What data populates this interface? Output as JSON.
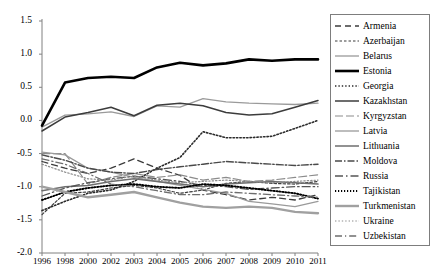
{
  "chart_data": {
    "type": "line",
    "title": "",
    "xlabel": "",
    "ylabel": "",
    "ylim": [
      -2.0,
      1.5
    ],
    "yticks": [
      "1.5",
      "1.0",
      "0.5",
      "0.0",
      "-0.5",
      "-1.0",
      "-1.5",
      "-2.0"
    ],
    "ytick_values": [
      1.5,
      1.0,
      0.5,
      0.0,
      -0.5,
      -1.0,
      -1.5,
      -2.0
    ],
    "grid": false,
    "legend_position": "right",
    "categories": [
      "1996",
      "1998",
      "2000",
      "2002",
      "2003",
      "2004",
      "2005",
      "2006",
      "2007",
      "2008",
      "2009",
      "2010",
      "2011"
    ],
    "series": [
      {
        "name": "Armenia",
        "color": "#3c3c3c",
        "dash": "6,4",
        "width": 1.3,
        "values": [
          -0.62,
          -0.72,
          -0.8,
          -0.72,
          -0.58,
          -0.72,
          -0.83,
          -1.05,
          -1.12,
          -1.2,
          -1.16,
          -1.2,
          -1.12
        ]
      },
      {
        "name": "Azerbaijan",
        "color": "#3c3c3c",
        "dash": "2.5,2",
        "width": 1.2,
        "values": [
          -1.42,
          -1.1,
          -1.08,
          -1.02,
          -0.98,
          -1.02,
          -1.1,
          -1.05,
          -0.95,
          -0.92,
          -0.95,
          -0.96,
          -0.92
        ]
      },
      {
        "name": "Belarus",
        "color": "#9a9a9a",
        "dash": "none",
        "width": 1.3,
        "values": [
          -0.1,
          0.08,
          0.1,
          0.13,
          0.06,
          0.22,
          0.2,
          0.33,
          0.28,
          0.26,
          0.25,
          0.24,
          0.26
        ]
      },
      {
        "name": "Estonia",
        "color": "#000000",
        "dash": "none",
        "width": 2.6,
        "values": [
          -0.08,
          0.57,
          0.64,
          0.66,
          0.64,
          0.8,
          0.87,
          0.83,
          0.86,
          0.92,
          0.9,
          0.92,
          0.92
        ]
      },
      {
        "name": "Georgia",
        "color": "#2b2b2b",
        "dash": "1.4,2",
        "width": 1.6,
        "values": [
          -1.36,
          -1.22,
          -1.1,
          -1.05,
          -0.92,
          -0.72,
          -0.56,
          -0.17,
          -0.26,
          -0.26,
          -0.24,
          -0.12,
          0.0
        ]
      },
      {
        "name": "Kazakhstan",
        "color": "#3c3c3c",
        "dash": "none",
        "width": 1.5,
        "values": [
          -0.16,
          0.05,
          0.12,
          0.2,
          0.07,
          0.23,
          0.26,
          0.22,
          0.12,
          0.08,
          0.1,
          0.2,
          0.3
        ]
      },
      {
        "name": "Kyrgyzstan",
        "color": "#8c8c8c",
        "dash": "8,3",
        "width": 1.2,
        "values": [
          -0.5,
          -0.5,
          -0.96,
          -0.86,
          -0.8,
          -0.86,
          -0.82,
          -0.9,
          -0.86,
          -0.92,
          -0.9,
          -0.86,
          -0.82
        ]
      },
      {
        "name": "Latvia",
        "color": "#9a9a9a",
        "dash": "none",
        "width": 1.3,
        "values": [
          -0.48,
          -0.52,
          -0.72,
          -0.78,
          -0.86,
          -0.92,
          -0.98,
          -1.04,
          -1.1,
          -1.22,
          -1.26,
          -1.3,
          -1.22
        ]
      },
      {
        "name": "Lithuania",
        "color": "#6e6e6e",
        "dash": "none",
        "width": 1.5,
        "values": [
          -1.06,
          -1.0,
          -0.98,
          -0.92,
          -0.88,
          -0.92,
          -0.96,
          -1.0,
          -0.96,
          -0.94,
          -0.92,
          -0.94,
          -0.96
        ]
      },
      {
        "name": "Moldova",
        "color": "#4a4a4a",
        "dash": "7,2,1.5,2",
        "width": 1.4,
        "values": [
          -0.52,
          -0.6,
          -0.72,
          -0.78,
          -0.8,
          -0.74,
          -0.7,
          -0.66,
          -0.62,
          -0.64,
          -0.66,
          -0.68,
          -0.66
        ]
      },
      {
        "name": "Russia",
        "color": "#555555",
        "dash": "8,3,1.5,3",
        "width": 1.3,
        "values": [
          -1.14,
          -1.02,
          -0.94,
          -0.88,
          -0.84,
          -0.88,
          -0.92,
          -0.98,
          -1.0,
          -1.04,
          -1.02,
          -1.0,
          -1.0
        ]
      },
      {
        "name": "Tajikistan",
        "color": "#000000",
        "dash": "1.2,1.8",
        "width": 1.9,
        "values": [
          -1.2,
          -1.08,
          -1.02,
          -0.98,
          -0.96,
          -1.0,
          -1.02,
          -0.96,
          -0.98,
          -1.02,
          -1.06,
          -1.1,
          -1.18
        ]
      },
      {
        "name": "Turkmenistan",
        "color": "#a0a0a0",
        "dash": "none",
        "width": 2.4,
        "values": [
          -1.0,
          -1.08,
          -1.16,
          -1.12,
          -1.08,
          -1.16,
          -1.24,
          -1.3,
          -1.32,
          -1.3,
          -1.32,
          -1.38,
          -1.4
        ]
      },
      {
        "name": "Ukraine",
        "color": "#8c8c8c",
        "dash": "1.4,2",
        "width": 1.2,
        "values": [
          -0.66,
          -0.78,
          -0.88,
          -0.9,
          -0.84,
          -0.9,
          -0.94,
          -0.92,
          -0.9,
          -0.92,
          -0.94,
          -0.92,
          -0.9
        ]
      },
      {
        "name": "Uzbekistan",
        "color": "#6e6e6e",
        "dash": "7,3,1.2,3",
        "width": 1.3,
        "values": [
          -0.58,
          -0.66,
          -0.8,
          -0.96,
          -1.0,
          -1.06,
          -1.12,
          -1.12,
          -1.08,
          -1.1,
          -1.12,
          -1.14,
          -1.16
        ]
      }
    ]
  },
  "legend": {
    "items": [
      {
        "label": "Armenia"
      },
      {
        "label": "Azerbaijan"
      },
      {
        "label": "Belarus"
      },
      {
        "label": "Estonia"
      },
      {
        "label": "Georgia"
      },
      {
        "label": "Kazakhstan"
      },
      {
        "label": "Kyrgyzstan"
      },
      {
        "label": "Latvia"
      },
      {
        "label": "Lithuania"
      },
      {
        "label": "Moldova"
      },
      {
        "label": "Russia"
      },
      {
        "label": "Tajikistan"
      },
      {
        "label": "Turkmenistan"
      },
      {
        "label": "Ukraine"
      },
      {
        "label": "Uzbekistan"
      }
    ]
  }
}
